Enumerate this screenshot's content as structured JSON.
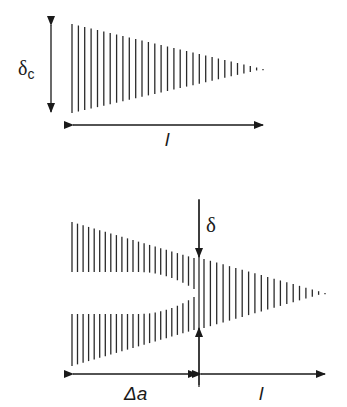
{
  "figure": {
    "top_panel": {
      "thickness_label": "δ",
      "thickness_subscript": "c",
      "length_label": "l",
      "wedge": {
        "x_start": 72,
        "x_end": 263,
        "top_start": 24,
        "bottom_start": 113,
        "tip_y": 69,
        "line_count": 31
      }
    },
    "bottom_panel": {
      "opening_label": "δ",
      "crack_extension_label": "Δa",
      "length_label": "l",
      "wake_upper": {
        "x_start": 72,
        "x_end": 194,
        "top_start": 222,
        "top_end": 258
      },
      "wake_lower": {
        "x_start": 72,
        "x_end": 194,
        "bottom_start": 366,
        "bottom_end": 330
      },
      "wedge": {
        "x_start": 204,
        "x_end": 325,
        "top_start": 259,
        "bottom_start": 328,
        "tip_y": 293,
        "line_count": 20
      }
    },
    "colors": {
      "ink": "#1a1a1a",
      "hatch": "#2a2a2a"
    }
  }
}
